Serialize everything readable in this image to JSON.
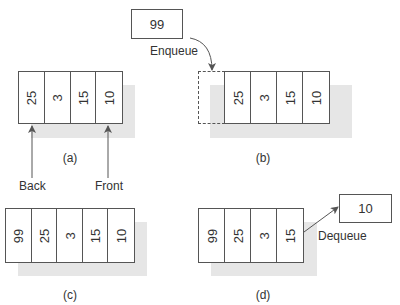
{
  "diagrams": {
    "a": {
      "caption": "(a)",
      "cells": [
        "25",
        "3",
        "15",
        "10"
      ],
      "pointers": {
        "back": "Back",
        "front": "Front"
      }
    },
    "b": {
      "caption": "(b)",
      "incoming_value": "99",
      "operation": "Enqueue",
      "cells": [
        "25",
        "3",
        "15",
        "10"
      ]
    },
    "c": {
      "caption": "(c)",
      "cells": [
        "99",
        "25",
        "3",
        "15",
        "10"
      ]
    },
    "d": {
      "caption": "(d)",
      "cells": [
        "99",
        "25",
        "3",
        "15"
      ],
      "operation": "Dequeue",
      "outgoing_value": "10"
    }
  },
  "colors": {
    "line": "#555555",
    "shadow": "#e6e6e6",
    "text": "#333333"
  }
}
